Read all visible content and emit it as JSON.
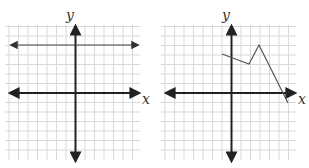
{
  "graphs": [
    {
      "id": "left",
      "x_label": "x",
      "y_label": "y",
      "description": "horizontal line y = 5",
      "line": {
        "type": "horizontal",
        "y": 5
      }
    },
    {
      "id": "right",
      "x_label": "x",
      "y_label": "y",
      "description": "piecewise linear segments",
      "points": [
        [
          -1,
          4
        ],
        [
          2,
          3
        ],
        [
          3,
          5
        ],
        [
          6,
          -1
        ]
      ]
    }
  ],
  "colors": {
    "grid": "#d9d9d9",
    "axis": "#222222",
    "line": "#555555"
  }
}
